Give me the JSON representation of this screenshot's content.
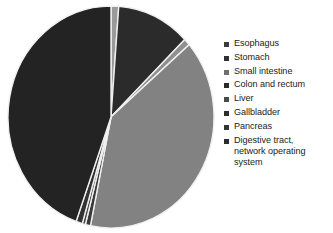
{
  "chart_data": {
    "type": "pie",
    "title": "",
    "xlabel": "",
    "ylabel": "",
    "legend_position": "right",
    "grid": false,
    "start_angle_deg": -90,
    "direction": "clockwise",
    "categories": [
      "Esophagus",
      "Stomach",
      "Small intestine",
      "Colon and rectum",
      "Liver",
      "Gallbladder",
      "Pancreas",
      "Digestive tract, network operating system"
    ],
    "values": [
      1.2,
      11.5,
      1.0,
      39.5,
      0.8,
      0.5,
      1.0,
      44.5
    ],
    "value_unit": "percent",
    "colors": [
      "#9a9a9a",
      "#2b2b2b",
      "#8f8f8f",
      "#828282",
      "#3a3a3a",
      "#4a4a4a",
      "#333333",
      "#232323"
    ],
    "slice_gap_color": "#f0f0f0",
    "slices": [
      {
        "label": "Esophagus",
        "value": 1.2,
        "color": "#9a9a9a"
      },
      {
        "label": "Stomach",
        "value": 11.5,
        "color": "#2b2b2b"
      },
      {
        "label": "Small intestine",
        "value": 1.0,
        "color": "#8f8f8f"
      },
      {
        "label": "Colon and rectum",
        "value": 39.5,
        "color": "#828282"
      },
      {
        "label": "Liver",
        "value": 0.8,
        "color": "#3a3a3a"
      },
      {
        "label": "Gallbladder",
        "value": 0.5,
        "color": "#4a4a4a"
      },
      {
        "label": "Pancreas",
        "value": 1.0,
        "color": "#333333"
      },
      {
        "label": "Digestive tract, network operating system",
        "value": 44.5,
        "color": "#232323"
      }
    ]
  },
  "legend": {
    "items": [
      {
        "label": "Esophagus",
        "color": "#3c3c3c"
      },
      {
        "label": "Stomach",
        "color": "#303030"
      },
      {
        "label": "Small intestine",
        "color": "#6f6f6f"
      },
      {
        "label": "Colon and rectum",
        "color": "#2a2a2a"
      },
      {
        "label": "Liver",
        "color": "#4a4a4a"
      },
      {
        "label": "Gallbladder",
        "color": "#2e2e2e"
      },
      {
        "label": "Pancreas",
        "color": "#353535"
      },
      {
        "label": "Digestive tract,\nnetwork operating\nsystem",
        "color": "#2c2c2c"
      }
    ]
  }
}
